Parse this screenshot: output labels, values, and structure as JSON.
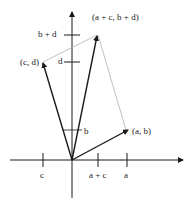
{
  "diagram": {
    "labels": {
      "point_ab": "(a, b)",
      "point_cd": "(c, d)",
      "point_sum": "(a + c, b + d)",
      "tick_b_plus_d": "b + d",
      "tick_d": "d",
      "tick_b": "b",
      "tick_c": "c",
      "tick_a_plus_c": "a + c",
      "tick_a": "a"
    },
    "colors": {
      "vector": "#1a1a1a",
      "axis": "#1a1a1a",
      "guide": "#b0b0b0"
    }
  }
}
